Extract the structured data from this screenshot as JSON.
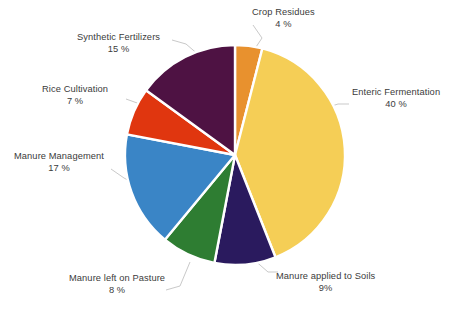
{
  "chart_data": {
    "type": "pie",
    "title": "",
    "subtitle": "",
    "xlabel": "",
    "ylabel": "",
    "legend_position": "none",
    "grid": false,
    "labels_outside": true,
    "leader_lines": true,
    "start_angle_deg": 0,
    "direction": "clockwise",
    "categories": [
      "Crop Residues",
      "Enteric Fermentation",
      "Manure applied to Soils",
      "Manure left on Pasture",
      "Manure Management",
      "Rice Cultivation",
      "Synthetic Fertilizers"
    ],
    "values": [
      4,
      40,
      9,
      8,
      17,
      7,
      15
    ],
    "value_labels": [
      "4 %",
      "40 %",
      "9%",
      "8 %",
      "17 %",
      "7 %",
      "15 %"
    ],
    "colors": [
      "#E8912E",
      "#F5CE56",
      "#2A1A5E",
      "#2E7D32",
      "#3A85C6",
      "#E0360F",
      "#4E1243"
    ],
    "units": "percent",
    "total": 100
  },
  "pie": {
    "center_x": 235,
    "center_y": 155,
    "radius": 110,
    "slice_gap_color": "#ffffff",
    "slice_gap_width": 2.4,
    "slices": [
      {
        "key": "crop-residues",
        "name": "Crop Residues",
        "value": 4,
        "value_label": "4 %",
        "color": "#E8912E",
        "start_deg": 0,
        "end_deg": 14.4
      },
      {
        "key": "enteric-fermentation",
        "name": "Enteric Fermentation",
        "value": 40,
        "value_label": "40 %",
        "color": "#F5CE56",
        "start_deg": 14.4,
        "end_deg": 158.4
      },
      {
        "key": "manure-applied-to-soils",
        "name": "Manure applied to Soils",
        "value": 9,
        "value_label": "9%",
        "color": "#2A1A5E",
        "start_deg": 158.4,
        "end_deg": 190.8
      },
      {
        "key": "manure-left-on-pasture",
        "name": "Manure left on Pasture",
        "value": 8,
        "value_label": "8 %",
        "color": "#2E7D32",
        "start_deg": 190.8,
        "end_deg": 219.6
      },
      {
        "key": "manure-management",
        "name": "Manure Management",
        "value": 17,
        "value_label": "17 %",
        "color": "#3A85C6",
        "start_deg": 219.6,
        "end_deg": 280.8
      },
      {
        "key": "rice-cultivation",
        "name": "Rice Cultivation",
        "value": 7,
        "value_label": "7 %",
        "color": "#E0360F",
        "start_deg": 280.8,
        "end_deg": 306.0
      },
      {
        "key": "synthetic-fertilizers",
        "name": "Synthetic Fertilizers",
        "value": 15,
        "value_label": "15 %",
        "color": "#4E1243",
        "start_deg": 306.0,
        "end_deg": 360.0
      }
    ]
  },
  "labels": {
    "crop_residues": {
      "name": "Crop Residues",
      "value": "4 %"
    },
    "enteric": {
      "name": "Enteric Fermentation",
      "value": "40 %"
    },
    "manure_soils": {
      "name": "Manure applied to Soils",
      "value": "9%"
    },
    "manure_pasture": {
      "name": "Manure left on Pasture",
      "value": "8 %"
    },
    "manure_management": {
      "name": "Manure Management",
      "value": "17 %"
    },
    "rice_cultivation": {
      "name": "Rice Cultivation",
      "value": "7 %"
    },
    "synthetic_fertilizers": {
      "name": "Synthetic Fertilizers",
      "value": "15 %"
    }
  },
  "style": {
    "background": "#ffffff",
    "label_color": "#3b3b3b",
    "leader_line_color": "#c9c9c9"
  }
}
